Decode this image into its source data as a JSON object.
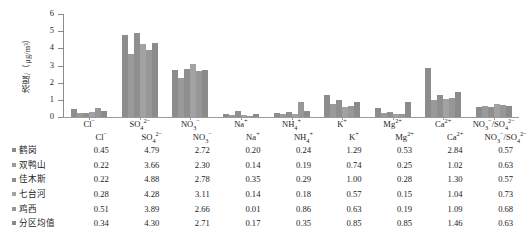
{
  "chart_data": {
    "type": "bar",
    "title": "",
    "xlabel": "",
    "ylabel": "浓度/（μg/m³）",
    "ylim": [
      0,
      6
    ],
    "yticks": [
      0,
      1,
      2,
      3,
      4,
      5,
      6
    ],
    "grid": false,
    "legend_position": "table-below",
    "categories": [
      "Cl⁻",
      "SO₄²⁻",
      "NO₃⁻",
      "Na⁺",
      "NH₄⁺",
      "K⁺",
      "Mg²⁺",
      "Ca²⁺",
      "NO₃⁻/SO₄²⁻"
    ],
    "series": [
      {
        "name": "鹤岗",
        "color": "#8c8c8c",
        "values": [
          0.45,
          4.79,
          2.72,
          0.2,
          0.24,
          1.29,
          0.53,
          2.84,
          0.57
        ]
      },
      {
        "name": "双鸭山",
        "color": "#9a9a9a",
        "values": [
          0.22,
          3.66,
          2.3,
          0.14,
          0.19,
          0.74,
          0.25,
          1.02,
          0.63
        ]
      },
      {
        "name": "佳木斯",
        "color": "#8f8f8f",
        "values": [
          0.22,
          4.88,
          2.78,
          0.35,
          0.29,
          1.0,
          0.28,
          1.3,
          0.57
        ]
      },
      {
        "name": "七台河",
        "color": "#a2a2a2",
        "values": [
          0.28,
          4.28,
          3.11,
          0.14,
          0.18,
          0.57,
          0.15,
          1.04,
          0.73
        ]
      },
      {
        "name": "鸡西",
        "color": "#979797",
        "values": [
          0.51,
          3.89,
          2.66,
          0.01,
          0.86,
          0.63,
          0.19,
          1.09,
          0.68
        ]
      },
      {
        "name": "分区均值",
        "color": "#8b8b8b",
        "values": [
          0.34,
          4.3,
          2.71,
          0.17,
          0.35,
          0.85,
          0.85,
          1.46,
          0.63
        ]
      }
    ]
  },
  "table": {
    "corner": "",
    "headers": [
      "Cl⁻",
      "SO₄²⁻",
      "NO₃⁻",
      "Na⁺",
      "NH₄⁺",
      "K⁺",
      "Mg²⁺",
      "Ca²⁺",
      "NO₃⁻/SO₄²⁻"
    ],
    "rows": [
      {
        "label": "鹤岗",
        "color": "#8c8c8c",
        "values": [
          "0.45",
          "4.79",
          "2.72",
          "0.20",
          "0.24",
          "1.29",
          "0.53",
          "2.84",
          "0.57"
        ]
      },
      {
        "label": "双鸭山",
        "color": "#9a9a9a",
        "values": [
          "0.22",
          "3.66",
          "2.30",
          "0.14",
          "0.19",
          "0.74",
          "0.25",
          "1.02",
          "0.63"
        ]
      },
      {
        "label": "佳木斯",
        "color": "#8f8f8f",
        "values": [
          "0.22",
          "4.88",
          "2.78",
          "0.35",
          "0.29",
          "1.00",
          "0.28",
          "1.30",
          "0.57"
        ]
      },
      {
        "label": "七台河",
        "color": "#a2a2a2",
        "values": [
          "0.28",
          "4.28",
          "3.11",
          "0.14",
          "0.18",
          "0.57",
          "0.15",
          "1.04",
          "0.73"
        ]
      },
      {
        "label": "鸡西",
        "color": "#979797",
        "values": [
          "0.51",
          "3.89",
          "2.66",
          "0.01",
          "0.86",
          "0.63",
          "0.19",
          "1.09",
          "0.68"
        ]
      },
      {
        "label": "分区均值",
        "color": "#8b8b8b",
        "values": [
          "0.34",
          "4.30",
          "2.71",
          "0.17",
          "0.35",
          "0.85",
          "0.85",
          "1.46",
          "0.63"
        ]
      }
    ]
  }
}
